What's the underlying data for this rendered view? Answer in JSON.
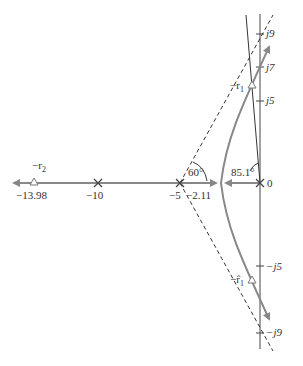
{
  "diagram": {
    "type": "root-locus",
    "colors": {
      "locus": "#888888",
      "axis": "#444444",
      "asymptote": "#333333",
      "text": "#333333"
    },
    "real_axis_labels": {
      "r2_value": "−13.98",
      "minus10": "−10",
      "minus5": "−5",
      "breakaway": "−2.11",
      "zero": "0"
    },
    "imag_axis_labels": {
      "j9": "j9",
      "j7": "j7",
      "j5": "j5",
      "mj5": "−j5",
      "mj9": "−j9"
    },
    "angle_labels": {
      "asymptote_angle": "60°",
      "departure_angle": "85.1°"
    },
    "root_labels": {
      "r2": "−r",
      "r2_sub": "2",
      "r1": "−r",
      "r1_sub": "1",
      "r1hat": "−r̂",
      "r1hat_sub": "1"
    },
    "poles": [
      0,
      -5,
      -10
    ],
    "asymptote_centroid": -5,
    "asymptote_angles_deg": [
      60,
      -60
    ],
    "breakaway_point": -2.11,
    "closed_loop_roots": [
      "-13.98",
      "-r1 (upper)",
      "-r1hat (lower)"
    ]
  }
}
